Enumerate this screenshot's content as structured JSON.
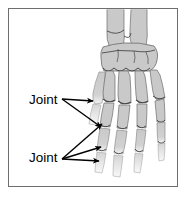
{
  "figure": {
    "name": "hand-skeleton-joint-diagram",
    "background_color": "#ffffff",
    "frame_color": "#6e6e6e",
    "bone_fill_color": "#c9c9c9",
    "bone_outline_color": "#5a5a5a",
    "annotation_color": "#000000"
  },
  "labels": {
    "upper": {
      "text": "Joint",
      "arrow_count": 2
    },
    "lower": {
      "text": "Joint",
      "arrow_count": 3
    }
  },
  "anatomy": {
    "parts": [
      "radius",
      "ulna",
      "carpals",
      "metacarpals",
      "proximal-phalanges",
      "middle-phalanges",
      "distal-phalanges"
    ]
  }
}
